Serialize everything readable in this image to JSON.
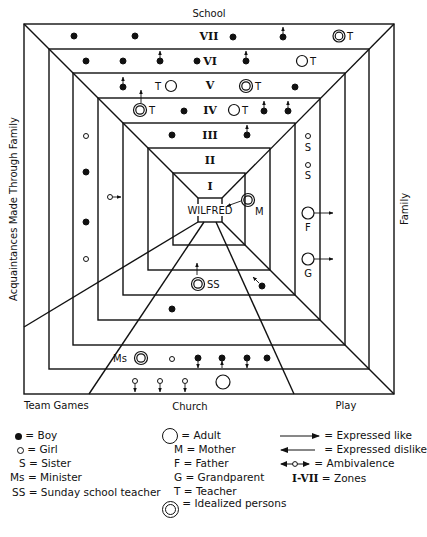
{
  "diagram": {
    "center_label": "WILFRED",
    "side_labels": {
      "top": "School",
      "right": "Family",
      "left": "Acquaintances Made Through Family",
      "bottom_left": "Team Games",
      "bottom_center": "Church",
      "bottom_right": "Play"
    },
    "zones": [
      {
        "id": "VII",
        "label": "VII"
      },
      {
        "id": "VI",
        "label": "VI"
      },
      {
        "id": "V",
        "label": "V"
      },
      {
        "id": "IV",
        "label": "IV"
      },
      {
        "id": "III",
        "label": "III"
      },
      {
        "id": "II",
        "label": "II"
      },
      {
        "id": "I",
        "label": "I"
      }
    ],
    "sectors": [
      {
        "name": "School",
        "persons": [
          {
            "zone": "VII",
            "type": "boy"
          },
          {
            "zone": "VII",
            "type": "boy"
          },
          {
            "zone": "VII",
            "type": "boy"
          },
          {
            "zone": "VII",
            "type": "boy",
            "relation": "expressed like"
          },
          {
            "zone": "VII",
            "type": "idealized",
            "tag": "T"
          },
          {
            "zone": "VI",
            "type": "boy"
          },
          {
            "zone": "VI",
            "type": "boy"
          },
          {
            "zone": "VI",
            "type": "boy",
            "relation": "expressed like"
          },
          {
            "zone": "VI",
            "type": "boy"
          },
          {
            "zone": "VI",
            "type": "boy",
            "relation": "expressed like"
          },
          {
            "zone": "VI",
            "type": "adult",
            "tag": "T"
          },
          {
            "zone": "V",
            "type": "boy",
            "relation": "expressed like"
          },
          {
            "zone": "V",
            "type": "adult",
            "tag": "T"
          },
          {
            "zone": "V",
            "type": "idealized",
            "tag": "T"
          },
          {
            "zone": "V",
            "type": "boy"
          },
          {
            "zone": "IV",
            "type": "idealized",
            "tag": "T",
            "relation": "expressed like"
          },
          {
            "zone": "IV",
            "type": "boy"
          },
          {
            "zone": "IV",
            "type": "adult",
            "tag": "T"
          },
          {
            "zone": "IV",
            "type": "boy",
            "relation": "expressed like"
          },
          {
            "zone": "IV",
            "type": "boy",
            "relation": "expressed like"
          },
          {
            "zone": "III",
            "type": "boy"
          },
          {
            "zone": "III",
            "type": "boy",
            "relation": "expressed like"
          }
        ]
      },
      {
        "name": "Family",
        "persons": [
          {
            "zone": "I",
            "type": "idealized",
            "tag": "M",
            "relation": "expressed dislike"
          },
          {
            "zone": "III",
            "type": "girl",
            "tag": "S"
          },
          {
            "zone": "III",
            "type": "girl",
            "tag": "S"
          },
          {
            "zone": "III",
            "type": "adult",
            "tag": "F",
            "relation": "expressed like"
          },
          {
            "zone": "III",
            "type": "adult",
            "tag": "G",
            "relation": "expressed like"
          }
        ]
      },
      {
        "name": "Acquaintances Made Through Family",
        "persons": [
          {
            "zone": "V",
            "type": "girl"
          },
          {
            "zone": "V",
            "type": "boy"
          },
          {
            "zone": "V",
            "type": "boy"
          },
          {
            "zone": "V",
            "type": "girl"
          },
          {
            "zone": "IV",
            "type": "girl",
            "relation": "expressed like"
          }
        ]
      },
      {
        "name": "Church",
        "persons": [
          {
            "zone": "III",
            "type": "idealized",
            "tag": "SS",
            "relation": "expressed like"
          },
          {
            "zone": "IV",
            "type": "boy"
          },
          {
            "zone": "VI",
            "type": "idealized",
            "tag": "Ms"
          },
          {
            "zone": "VI",
            "type": "girl"
          },
          {
            "zone": "VI",
            "type": "boy",
            "relation": "expressed like"
          },
          {
            "zone": "VI",
            "type": "boy",
            "relation": "expressed like"
          },
          {
            "zone": "VI",
            "type": "boy",
            "relation": "expressed like"
          },
          {
            "zone": "VI",
            "type": "boy"
          },
          {
            "zone": "VII",
            "type": "girl",
            "relation": "expressed like"
          },
          {
            "zone": "VII",
            "type": "girl",
            "relation": "expressed like"
          },
          {
            "zone": "VII",
            "type": "girl",
            "relation": "expressed like"
          },
          {
            "zone": "VII",
            "type": "adult",
            "relation": "expressed like"
          }
        ]
      },
      {
        "name": "Play",
        "persons": [
          {
            "zone": "III",
            "type": "boy",
            "relation": "expressed dislike"
          }
        ]
      }
    ],
    "tags": {
      "T": "T",
      "M": "M",
      "S": "S",
      "F": "F",
      "G": "G",
      "SS": "SS",
      "Ms": "Ms"
    }
  },
  "legend": {
    "col1": [
      {
        "symbol": "boy-dot",
        "text": "= Boy"
      },
      {
        "symbol": "girl-ring",
        "text": "= Girl"
      },
      {
        "symbol": "S",
        "text": "= Sister"
      },
      {
        "symbol": "Ms",
        "text": "= Minister"
      },
      {
        "symbol": "SS",
        "text": "= Sunday school teacher"
      }
    ],
    "col2": [
      {
        "symbol": "adult-circle",
        "text": "= Adult"
      },
      {
        "symbol": "M",
        "text": "= Mother"
      },
      {
        "symbol": "F",
        "text": "= Father"
      },
      {
        "symbol": "G",
        "text": "= Grandparent"
      },
      {
        "symbol": "T",
        "text": "= Teacher"
      },
      {
        "symbol": "idealized-double-circle",
        "text": "= Idealized persons"
      }
    ],
    "col3": [
      {
        "symbol": "arrow-right",
        "text": "= Expressed like"
      },
      {
        "symbol": "arrow-left",
        "text": "= Expressed dislike"
      },
      {
        "symbol": "arrow-both-circle",
        "text": "= Ambivalence"
      },
      {
        "symbol": "I-VII",
        "text": "= Zones"
      }
    ]
  }
}
